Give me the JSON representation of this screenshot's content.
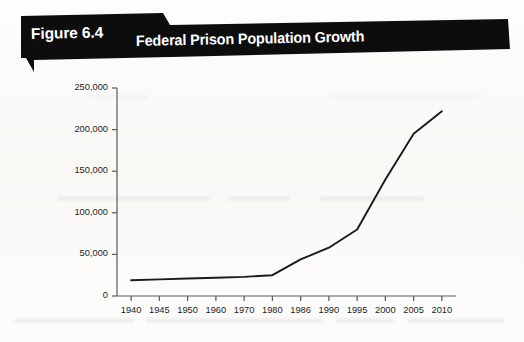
{
  "figure": {
    "label": "Figure 6.4",
    "title": "Federal Prison Population Growth"
  },
  "colors": {
    "banner": "#0d0d0d",
    "banner_text": "#ffffff",
    "line": "#1a1a1a",
    "axis": "#5a5a5a",
    "paper": "#fdfdfc"
  },
  "chart_data": {
    "type": "line",
    "title": "Federal Prison Population Growth",
    "xlabel": "",
    "ylabel": "",
    "categories": [
      "1940",
      "1945",
      "1950",
      "1960",
      "1970",
      "1980",
      "1986",
      "1990",
      "1995",
      "2000",
      "2005",
      "2010"
    ],
    "values": [
      19000,
      20000,
      21000,
      22000,
      23000,
      25000,
      44000,
      58000,
      80000,
      140000,
      195000,
      222000
    ],
    "series": [
      {
        "name": "Federal prison population",
        "values": [
          19000,
          20000,
          21000,
          22000,
          23000,
          25000,
          44000,
          58000,
          80000,
          140000,
          195000,
          222000
        ]
      }
    ],
    "ylim": [
      0,
      250000
    ],
    "yticks": [
      0,
      50000,
      100000,
      150000,
      200000,
      250000
    ],
    "ytick_labels": [
      "0",
      "50,000",
      "100,000",
      "150,000",
      "200,000",
      "250,000"
    ],
    "grid": false,
    "legend": false,
    "legend_position": "none"
  }
}
